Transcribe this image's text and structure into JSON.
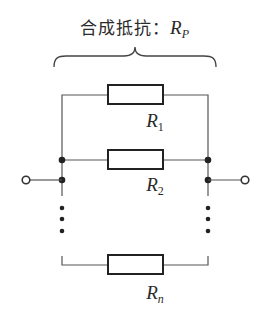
{
  "diagram": {
    "title": {
      "text": "合成抵抗：",
      "symbol": "R",
      "subscript": "P"
    },
    "resistors": [
      {
        "id": "R1",
        "symbol": "R",
        "subscript": "1"
      },
      {
        "id": "R2",
        "symbol": "R",
        "subscript": "2"
      },
      {
        "id": "Rn",
        "symbol": "R",
        "subscript": "n"
      }
    ],
    "ellipsis": "⋮",
    "colors": {
      "line": "#555555",
      "box": "#222222",
      "text": "#2a2a2a",
      "background": "#ffffff"
    }
  }
}
